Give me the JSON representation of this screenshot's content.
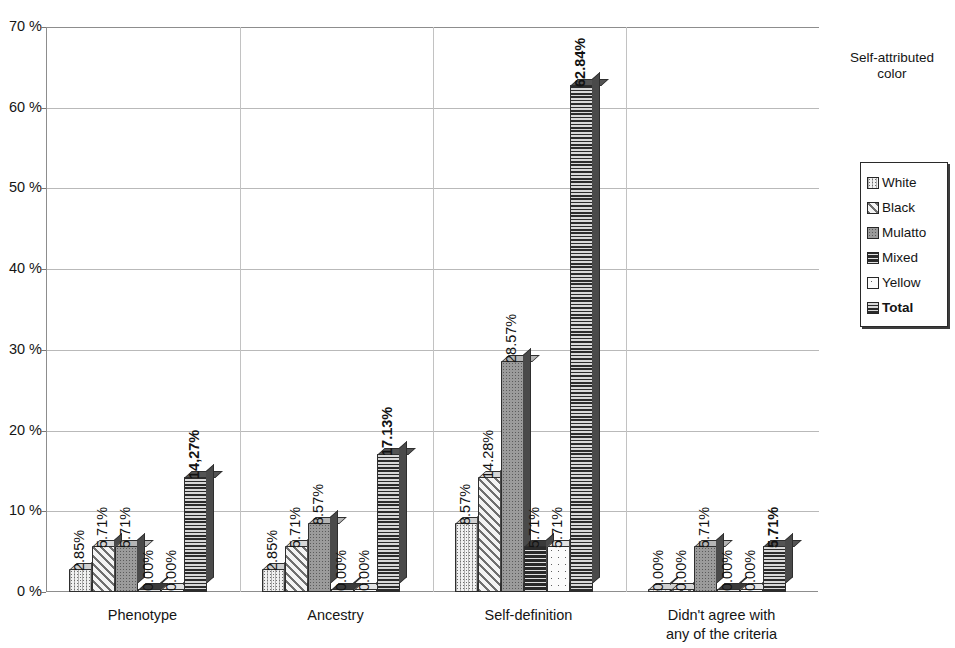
{
  "chart_data": {
    "type": "bar",
    "title": "",
    "xlabel": "",
    "ylabel": "",
    "ylim": [
      0,
      70
    ],
    "ytick_labels": [
      "0 %",
      "10 %",
      "20 %",
      "30 %",
      "40 %",
      "50 %",
      "60 %",
      "70 %"
    ],
    "ytick_values": [
      0,
      10,
      20,
      30,
      40,
      50,
      60,
      70
    ],
    "grid": true,
    "legend_position": "right",
    "categories": [
      "Phenotype",
      "Ancestry",
      "Self-definition",
      "Didn't agree with any of the criteria"
    ],
    "series": [
      {
        "name": "White",
        "pattern": "fine-dot-grid",
        "values": [
          2.85,
          2.85,
          8.57,
          0.0
        ],
        "labels": [
          "2.85%",
          "2.85%",
          "8.57%",
          "0.00%"
        ]
      },
      {
        "name": "Black",
        "pattern": "diagonal-hatch",
        "values": [
          5.71,
          5.71,
          14.28,
          0.0
        ],
        "labels": [
          "5.71%",
          "5.71%",
          "14.28%",
          "0.00%"
        ]
      },
      {
        "name": "Mulatto",
        "pattern": "dense-gray-dot",
        "values": [
          5.71,
          8.57,
          28.57,
          5.71
        ],
        "labels": [
          "5.71%",
          "8.57%",
          "28.57%",
          "5.71%"
        ]
      },
      {
        "name": "Mixed",
        "pattern": "dark-wavy",
        "values": [
          0.0,
          0.0,
          5.71,
          0.0
        ],
        "labels": [
          "0.00%",
          "0.00%",
          "5.71%",
          "0.00%"
        ]
      },
      {
        "name": "Yellow",
        "pattern": "sparse-dot-light",
        "values": [
          0.0,
          0.0,
          5.71,
          0.0
        ],
        "labels": [
          "0.00%",
          "0.00%",
          "5.71%",
          "0.00%"
        ]
      },
      {
        "name": "Total",
        "pattern": "horizontal-line",
        "values": [
          14.27,
          17.13,
          62.84,
          5.71
        ],
        "labels": [
          "14,27%",
          "17.13%",
          "62.84%",
          "5.71%"
        ],
        "bold": true
      }
    ]
  },
  "legend": {
    "title": "Self-attributed color",
    "items": [
      {
        "label": "White",
        "pattern": "fine-dot-grid",
        "bold": false
      },
      {
        "label": "Black",
        "pattern": "diagonal-hatch",
        "bold": false
      },
      {
        "label": "Mulatto",
        "pattern": "dense-gray-dot",
        "bold": false
      },
      {
        "label": "Mixed",
        "pattern": "dark-wavy",
        "bold": false
      },
      {
        "label": "Yellow",
        "pattern": "sparse-dot-light",
        "bold": false
      },
      {
        "label": "Total",
        "pattern": "horizontal-line",
        "bold": true
      }
    ]
  },
  "colors": {
    "axis": "#8d8d8d",
    "grid": "#b9b9b9",
    "text": "#151515",
    "bar_outline": "#2e2e2e"
  }
}
